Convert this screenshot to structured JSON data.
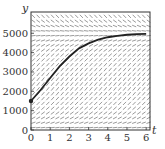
{
  "chart_data": {
    "type": "line",
    "subtype": "slope-field-with-solution-curve",
    "title": "",
    "xlabel": "t",
    "ylabel": "y",
    "xlim": [
      0,
      6.2
    ],
    "ylim": [
      0,
      6100
    ],
    "x_ticks": [
      0,
      1,
      2,
      3,
      4,
      5,
      6
    ],
    "x_tick_labels": [
      "0",
      "1",
      "2",
      "3",
      "4",
      "5",
      "6"
    ],
    "y_ticks": [
      0,
      1000,
      2000,
      3000,
      4000,
      5000
    ],
    "y_tick_labels": [
      "0",
      "1000",
      "2000",
      "3000",
      "4000",
      "5000"
    ],
    "grid": false,
    "legend": null,
    "slope_field": {
      "equation": "dy/dt = r*y*(1 - y/K)",
      "r": 1.0,
      "K": 5000,
      "t_step": 0.25,
      "y_step": 250,
      "color": "#555555"
    },
    "series": [
      {
        "name": "solution",
        "initial_point": [
          0,
          1500
        ],
        "x": [
          0,
          0.5,
          1,
          1.5,
          2,
          2.5,
          3,
          3.5,
          4,
          4.5,
          5,
          5.5,
          6
        ],
        "values": [
          1500,
          2069,
          2691,
          3303,
          3800,
          4220,
          4480,
          4670,
          4795,
          4870,
          4923,
          4953,
          4971
        ],
        "color": "#222222"
      }
    ]
  }
}
